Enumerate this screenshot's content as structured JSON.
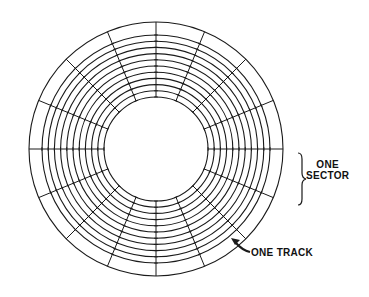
{
  "diagram": {
    "type": "disk-tracks-sectors",
    "sectors": 16,
    "tracks": 11,
    "labels": {
      "sector_line1": "ONE",
      "sector_line2": "SECTOR",
      "track": "ONE TRACK"
    },
    "colors": {
      "line": "#1a1a1a",
      "background": "#ffffff"
    }
  }
}
